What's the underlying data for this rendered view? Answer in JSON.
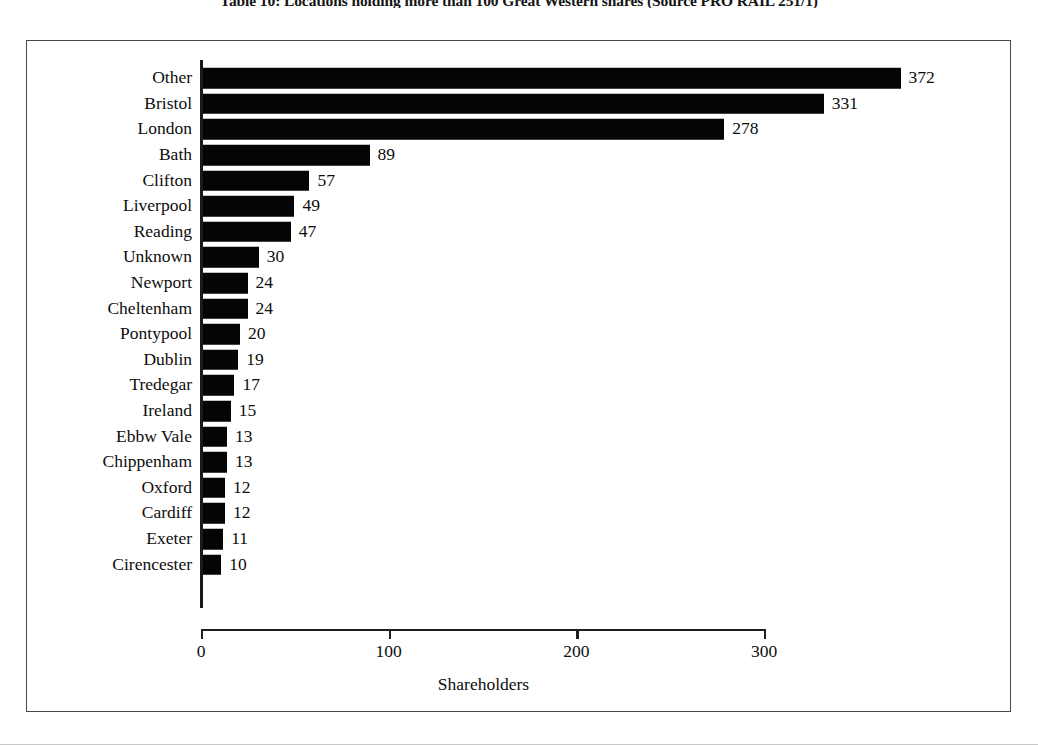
{
  "caption": {
    "text": "Table 10: Locations holding more than 100 Great Western shares (Source PRO RAIL 251/1)"
  },
  "chart_data": {
    "type": "bar",
    "orientation": "horizontal",
    "title": "",
    "xlabel": "Shareholders",
    "ylabel": "",
    "xlim": [
      0,
      300
    ],
    "x_ticks": [
      0,
      100,
      200,
      300
    ],
    "x_tick_labels": [
      "0",
      "100",
      "200",
      "300"
    ],
    "grid": false,
    "legend": false,
    "bar_color": "#050505",
    "categories": [
      "Other",
      "Bristol",
      "London",
      "Bath",
      "Clifton",
      "Liverpool",
      "Reading",
      "Unknown",
      "Newport",
      "Cheltenham",
      "Pontypool",
      "Dublin",
      "Tredegar",
      "Ireland",
      "Ebbw Vale",
      "Chippenham",
      "Oxford",
      "Cardiff",
      "Exeter",
      "Cirencester"
    ],
    "values": [
      372,
      331,
      278,
      89,
      57,
      49,
      47,
      30,
      24,
      24,
      20,
      19,
      17,
      15,
      13,
      13,
      12,
      12,
      11,
      10
    ],
    "value_labels": [
      "372",
      "331",
      "278",
      "89",
      "57",
      "49",
      "47",
      "30",
      "24",
      "24",
      "20",
      "19",
      "17",
      "15",
      "13",
      "13",
      "12",
      "12",
      "11",
      "10"
    ]
  },
  "colors": {
    "bar": "#050505",
    "frame": "#4a4a4a",
    "axis": "#1f1f1f",
    "text": "#0d0d0d",
    "background": "#ffffff"
  }
}
